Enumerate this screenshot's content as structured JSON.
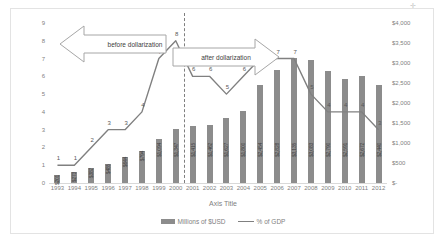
{
  "chart_data": {
    "type": "bar",
    "title": "",
    "xlabel": "Axis Title",
    "ylabel": "",
    "categories": [
      "1993",
      "1994",
      "1995",
      "1996",
      "1997",
      "1998",
      "1999",
      "2000",
      "2001",
      "2002",
      "2003",
      "2004",
      "2005",
      "2006",
      "2007",
      "2008",
      "2009",
      "2010",
      "2011",
      "2012"
    ],
    "series": [
      {
        "name": "Millions of $USD",
        "type": "bar",
        "axis": "right",
        "values": [
          201,
          273,
          382,
          485,
          644,
          794,
          1094,
          1347,
          1415,
          1462,
          1627,
          1800,
          2454,
          2828,
          3135,
          3083,
          2790,
          2591,
          2672,
          2440
        ],
        "labels": [
          "$201",
          "$273",
          "$382",
          "$485",
          "$644",
          "$794",
          "$1,094",
          "$1,347",
          "$1,415",
          "$1,462",
          "$1,627",
          "$1,800",
          "$2,454",
          "$2,828",
          "$3,135",
          "$3,083",
          "$2,790",
          "$2,591",
          "$2,672",
          "$2,440"
        ]
      },
      {
        "name": "% of GDP",
        "type": "line",
        "axis": "left",
        "values": [
          1,
          1,
          2,
          3,
          3,
          4,
          7,
          8,
          6,
          6,
          5,
          6,
          7,
          7,
          7,
          5,
          4,
          4,
          4,
          3
        ],
        "labels": [
          "1",
          "1",
          "2",
          "3",
          "3",
          "4",
          "7",
          "8",
          "6",
          "6",
          "5",
          "6",
          "7",
          "7",
          "7",
          "5",
          "4",
          "4",
          "4",
          "3"
        ]
      }
    ],
    "y_left": {
      "min": 0,
      "max": 9,
      "ticks": [
        "0",
        "1",
        "2",
        "3",
        "4",
        "5",
        "6",
        "7",
        "8",
        "9"
      ]
    },
    "y_right": {
      "min": 0,
      "max": 4000,
      "ticks": [
        "$-",
        "$500",
        "$1,000",
        "$1,500",
        "$2,000",
        "$2,500",
        "$3,000",
        "$3,500",
        "$4,000"
      ]
    },
    "grid": false,
    "legend_position": "bottom",
    "annotations": [
      {
        "name": "before-dollarization",
        "text": "before dollarization",
        "direction": "left"
      },
      {
        "name": "after-dollarization",
        "text": "after dollarization",
        "direction": "right"
      },
      {
        "name": "dollarization-divider",
        "text": "",
        "at_category": "2000"
      }
    ],
    "colors": {
      "bar": "#8c8c8c",
      "line": "#808080",
      "axis_text": "#7f7f7f",
      "frame": "#e3e3e3"
    }
  },
  "legend": {
    "bar_label": "Millions of $USD",
    "line_label": "% of GDP"
  },
  "marks": {
    "corner": "✛"
  }
}
